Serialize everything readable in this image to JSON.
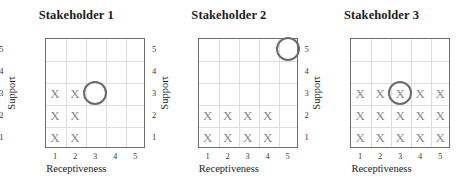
{
  "chart_data": [
    {
      "type": "scatter",
      "title": "Stakeholder 1",
      "xlabel": "Receptiveness",
      "ylabel": "Support",
      "xticks": [
        "1",
        "2",
        "3",
        "4",
        "5"
      ],
      "yticks": [
        "1",
        "2",
        "3",
        "4",
        "5"
      ],
      "xlim": [
        0.5,
        5.5
      ],
      "ylim": [
        0.5,
        5.5
      ],
      "grid": true,
      "legend": "none",
      "marker_symbol": "X",
      "points": [
        {
          "x": 1,
          "y": 3
        },
        {
          "x": 2,
          "y": 3
        },
        {
          "x": 1,
          "y": 2
        },
        {
          "x": 2,
          "y": 2
        },
        {
          "x": 1,
          "y": 1
        },
        {
          "x": 2,
          "y": 1
        }
      ],
      "annotations": [
        {
          "shape": "circle",
          "x": 3,
          "y": 3,
          "label": ""
        }
      ]
    },
    {
      "type": "scatter",
      "title": "Stakeholder 2",
      "xlabel": "Receptiveness",
      "ylabel": "Support",
      "xticks": [
        "1",
        "2",
        "3",
        "4",
        "5"
      ],
      "yticks": [
        "1",
        "2",
        "3",
        "4",
        "5"
      ],
      "xlim": [
        0.5,
        5.5
      ],
      "ylim": [
        0.5,
        5.5
      ],
      "grid": true,
      "legend": "none",
      "marker_symbol": "X",
      "points": [
        {
          "x": 1,
          "y": 2
        },
        {
          "x": 2,
          "y": 2
        },
        {
          "x": 3,
          "y": 2
        },
        {
          "x": 4,
          "y": 2
        },
        {
          "x": 1,
          "y": 1
        },
        {
          "x": 2,
          "y": 1
        },
        {
          "x": 3,
          "y": 1
        },
        {
          "x": 4,
          "y": 1
        }
      ],
      "annotations": [
        {
          "shape": "circle",
          "x": 5,
          "y": 5,
          "label": ""
        }
      ]
    },
    {
      "type": "scatter",
      "title": "Stakeholder 3",
      "xlabel": "Receptiveness",
      "ylabel": "Support",
      "xticks": [
        "1",
        "2",
        "3",
        "4",
        "5"
      ],
      "yticks": [
        "1",
        "2",
        "3",
        "4",
        "5"
      ],
      "xlim": [
        0.5,
        5.5
      ],
      "ylim": [
        0.5,
        5.5
      ],
      "grid": true,
      "legend": "none",
      "marker_symbol": "X",
      "points": [
        {
          "x": 1,
          "y": 3
        },
        {
          "x": 2,
          "y": 3
        },
        {
          "x": 3,
          "y": 3
        },
        {
          "x": 4,
          "y": 3
        },
        {
          "x": 5,
          "y": 3
        },
        {
          "x": 1,
          "y": 2
        },
        {
          "x": 2,
          "y": 2
        },
        {
          "x": 3,
          "y": 2
        },
        {
          "x": 4,
          "y": 2
        },
        {
          "x": 5,
          "y": 2
        },
        {
          "x": 1,
          "y": 1
        },
        {
          "x": 2,
          "y": 1
        },
        {
          "x": 3,
          "y": 1
        },
        {
          "x": 4,
          "y": 1
        },
        {
          "x": 5,
          "y": 1
        }
      ],
      "annotations": [
        {
          "shape": "circle",
          "x": 3,
          "y": 3,
          "label": ""
        }
      ]
    }
  ],
  "colors": {
    "marker": "#8a8a8a",
    "circle": "#6b6b6b",
    "axis": "#6e6e6e",
    "grid": "#dedede",
    "title": "#1b1b1b",
    "background": "#ffffff"
  }
}
